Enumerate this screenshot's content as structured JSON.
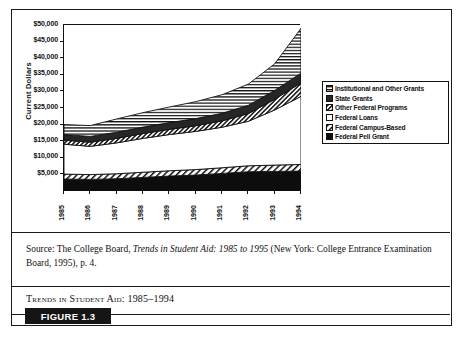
{
  "figure": {
    "badge_label": "FIGURE 1.3",
    "caption": "Trends in Student Aid: 1985–1994",
    "source_prefix": "Source: The College Board, ",
    "source_italic": "Trends in Student Aid: 1985 to 1995",
    "source_suffix": " (New York: College Entrance Examination Board, 1995), p. 4."
  },
  "chart_data": {
    "type": "area",
    "title": "Trends in Student Aid: 1985–1994",
    "xlabel": "",
    "ylabel": "Current Dollars",
    "categories": [
      "1985",
      "1986",
      "1987",
      "1988",
      "1989",
      "1990",
      "1991",
      "1992",
      "1993",
      "1994"
    ],
    "ytick_labels": [
      "$5,000",
      "$10,000",
      "$15,000",
      "$20,000",
      "$25,000",
      "$30,000",
      "$35,000",
      "$40,000",
      "$45,000",
      "$50,000"
    ],
    "ytick_values": [
      5000,
      10000,
      15000,
      20000,
      25000,
      30000,
      35000,
      40000,
      45000,
      50000
    ],
    "ylim": [
      0,
      50000
    ],
    "grid": false,
    "stacked": true,
    "legend_position": "right",
    "series": [
      {
        "name": "Federal Pell Grant",
        "pattern": "solid-black",
        "values": [
          3600,
          3500,
          3700,
          4100,
          4500,
          4800,
          5300,
          5800,
          5900,
          6000
        ]
      },
      {
        "name": "Federal Campus-Based",
        "pattern": "diagonal-hatch",
        "values": [
          1500,
          1450,
          1500,
          1550,
          1600,
          1650,
          1700,
          1800,
          1900,
          2000
        ]
      },
      {
        "name": "Federal Loans",
        "pattern": "white",
        "values": [
          9000,
          8500,
          9300,
          10200,
          10900,
          11500,
          12200,
          13400,
          16600,
          20500
        ]
      },
      {
        "name": "Other Federal Programs",
        "pattern": "fine-hatch",
        "values": [
          1200,
          1250,
          1350,
          1450,
          1550,
          1700,
          1900,
          2300,
          3200,
          4100
        ]
      },
      {
        "name": "State Grants",
        "pattern": "solid-dark",
        "values": [
          1700,
          1750,
          1850,
          1950,
          2050,
          2150,
          2300,
          2500,
          2700,
          2900
        ]
      },
      {
        "name": "Institutional and Other Grants",
        "pattern": "horizontal-lines",
        "values": [
          3000,
          3250,
          4000,
          4350,
          4700,
          5100,
          5600,
          6400,
          8000,
          13500
        ]
      }
    ],
    "legend_entries": [
      {
        "label": "Institutional and Other Grants",
        "pattern": "horizontal-lines"
      },
      {
        "label": "State Grants",
        "pattern": "solid-dark"
      },
      {
        "label": "Other Federal Programs",
        "pattern": "fine-hatch"
      },
      {
        "label": "Federal Loans",
        "pattern": "white"
      },
      {
        "label": "Federal Campus-Based",
        "pattern": "diagonal-hatch"
      },
      {
        "label": "Federal Pell Grant",
        "pattern": "solid-black"
      }
    ],
    "colors": {
      "ink": "#111111",
      "paper": "#ffffff",
      "state_grants": "#262626",
      "pell": "#0d0d0d"
    }
  }
}
